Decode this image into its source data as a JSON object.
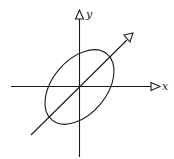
{
  "diagram": {
    "axes": {
      "x": {
        "label": "x"
      },
      "y": {
        "label": "y"
      }
    },
    "colors": {
      "stroke": "#1a1a1a",
      "background": "#ffffff"
    }
  }
}
